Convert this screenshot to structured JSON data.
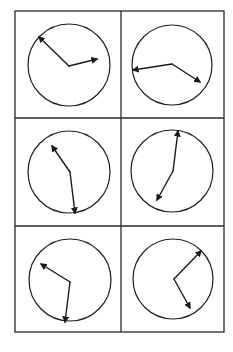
{
  "grid": {
    "left": 15,
    "top": 11,
    "right": 224,
    "bottom": 332,
    "col_divider_x": 121,
    "row_dividers_y": [
      118,
      226
    ],
    "line_color": "#2a2a2a",
    "line_width": 1.3
  },
  "style": {
    "circle_color": "#1e1e1e",
    "circle_width": 1.2,
    "hand_color": "#1a1a1a",
    "hand_width": 1.4
  },
  "clocks": [
    {
      "label": "clock-row1-left",
      "cx": 69,
      "cy": 65,
      "r": 41,
      "hub": [
        69,
        66
      ],
      "hands": [
        [
          39,
          37
        ],
        [
          97,
          59
        ]
      ]
    },
    {
      "label": "clock-row1-right",
      "cx": 172,
      "cy": 65,
      "r": 40,
      "hub": [
        172,
        64
      ],
      "hands": [
        [
          133,
          70
        ],
        [
          200,
          82
        ]
      ]
    },
    {
      "label": "clock-row2-left",
      "cx": 69,
      "cy": 172,
      "r": 41,
      "hub": [
        70,
        172
      ],
      "hands": [
        [
          52,
          146
        ],
        [
          75,
          213
        ]
      ]
    },
    {
      "label": "clock-row2-right",
      "cx": 172,
      "cy": 171,
      "r": 41,
      "hub": [
        173,
        171
      ],
      "hands": [
        [
          178,
          131
        ],
        [
          157,
          200
        ]
      ]
    },
    {
      "label": "clock-row3-left",
      "cx": 70,
      "cy": 280,
      "r": 41,
      "hub": [
        70,
        282
      ],
      "hands": [
        [
          41,
          264
        ],
        [
          65,
          322
        ]
      ]
    },
    {
      "label": "clock-row3-right",
      "cx": 173,
      "cy": 279,
      "r": 40,
      "hub": [
        174,
        279
      ],
      "hands": [
        [
          201,
          251
        ],
        [
          190,
          308
        ]
      ]
    }
  ]
}
